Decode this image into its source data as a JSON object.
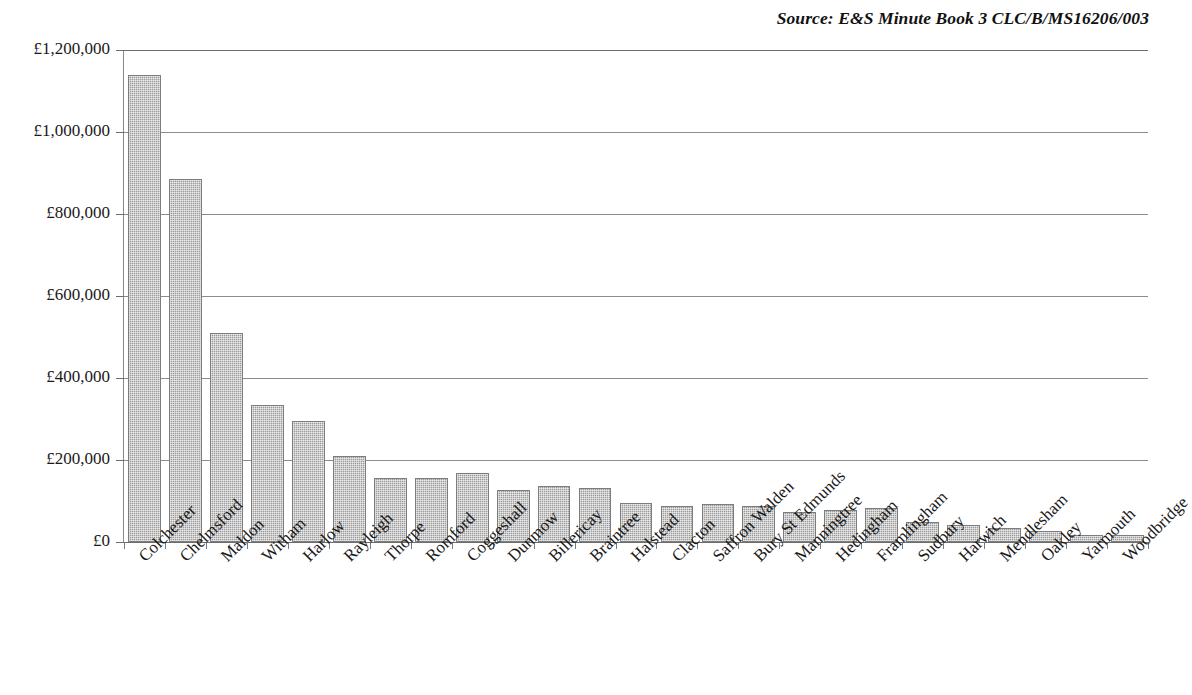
{
  "source_note": "Source: E&S Minute Book 3 CLC/B/MS16206/003",
  "colors": {
    "bar_fill": "#9a9a9a",
    "bar_border": "#7d7d7d",
    "gridline": "#8c8c8c",
    "axis": "#6d6d6d",
    "text": "#1a1a1a",
    "background": "#ffffff"
  },
  "chart_data": {
    "type": "bar",
    "title": "",
    "subtitle": "",
    "xlabel": "",
    "ylabel": "",
    "ylim": [
      0,
      1200000
    ],
    "ytick_step": 200000,
    "ytick_labels": [
      "£0",
      "£200,000",
      "£400,000",
      "£600,000",
      "£800,000",
      "£1,000,000",
      "£1,200,000"
    ],
    "ytick_values": [
      0,
      200000,
      400000,
      600000,
      800000,
      1000000,
      1200000
    ],
    "grid": true,
    "legend": false,
    "currency": "GBP",
    "categories": [
      "Colchester",
      "Chelmsford",
      "Maldon",
      "Witham",
      "Harlow",
      "Rayleigh",
      "Thorpe",
      "Romford",
      "Coggeshall",
      "Dunmow",
      "Billericay",
      "Braintree",
      "Halstead",
      "Clacton",
      "Saffron Walden",
      "Bury St Edmunds",
      "Manningtree",
      "Hedingham",
      "Framlingham",
      "Sudbury",
      "Harwich",
      "Mendlesham",
      "Oakley",
      "Yarmouth",
      "Woodbridge"
    ],
    "values": [
      1140000,
      885000,
      510000,
      335000,
      295000,
      210000,
      155000,
      157000,
      168000,
      128000,
      136000,
      132000,
      96000,
      88000,
      93000,
      87000,
      74000,
      78000,
      82000,
      48000,
      42000,
      34000,
      27000,
      16000,
      18000
    ],
    "annotations": [
      "Source: E&S Minute Book 3 CLC/B/MS16206/003"
    ]
  }
}
